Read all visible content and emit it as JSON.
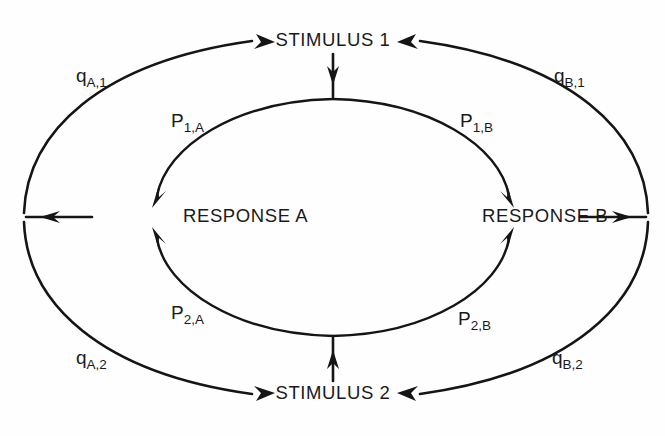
{
  "figure": {
    "background_color": "#fefefe",
    "ink_color": "#151515"
  },
  "nodes": [
    {
      "id": "stimulus-1",
      "label": "STIMULUS 1",
      "position": "top"
    },
    {
      "id": "stimulus-2",
      "label": "STIMULUS 2",
      "position": "bottom"
    },
    {
      "id": "response-a",
      "label": "RESPONSE A",
      "position": "left"
    },
    {
      "id": "response-b",
      "label": "RESPONSE B",
      "position": "right"
    }
  ],
  "edge_labels": {
    "q_a_1": {
      "base": "q",
      "sub": "A,1",
      "from": "response-a",
      "to": "stimulus-1",
      "ring": "outer"
    },
    "q_b_1": {
      "base": "q",
      "sub": "B,1",
      "from": "response-b",
      "to": "stimulus-1",
      "ring": "outer"
    },
    "q_a_2": {
      "base": "q",
      "sub": "A,2",
      "from": "response-a",
      "to": "stimulus-2",
      "ring": "outer"
    },
    "q_b_2": {
      "base": "q",
      "sub": "B,2",
      "from": "response-b",
      "to": "stimulus-2",
      "ring": "outer"
    },
    "p_1_a": {
      "base": "P",
      "sub": "1,A",
      "from": "stimulus-1",
      "to": "response-a",
      "ring": "inner"
    },
    "p_1_b": {
      "base": "P",
      "sub": "1,B",
      "from": "stimulus-1",
      "to": "response-b",
      "ring": "inner"
    },
    "p_2_a": {
      "base": "P",
      "sub": "2,A",
      "from": "stimulus-2",
      "to": "response-a",
      "ring": "inner"
    },
    "p_2_b": {
      "base": "P",
      "sub": "2,B",
      "from": "stimulus-2",
      "to": "response-b",
      "ring": "inner"
    }
  },
  "connectors": [
    {
      "id": "stim1-to-inner",
      "direction": "down",
      "description": "STIMULUS 1 down into inner ring"
    },
    {
      "id": "stim2-to-inner",
      "direction": "up",
      "description": "STIMULUS 2 up into inner ring"
    },
    {
      "id": "respa-to-outer",
      "direction": "left",
      "description": "RESPONSE A left into outer ring"
    },
    {
      "id": "respb-to-outer",
      "direction": "right",
      "description": "RESPONSE B right into outer ring"
    }
  ]
}
